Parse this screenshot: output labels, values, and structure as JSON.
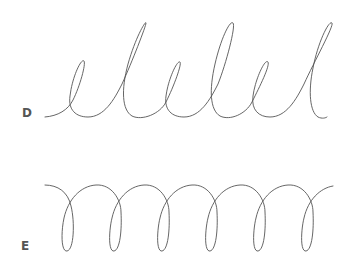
{
  "figures": [
    {
      "label": "D",
      "description": "Cursive looped line alternating small and tall loops (like repeated 'el')",
      "stroke_color": "#555555"
    },
    {
      "label": "E",
      "description": "Coiled spring-like line with six downward loops",
      "stroke_color": "#555555"
    }
  ]
}
